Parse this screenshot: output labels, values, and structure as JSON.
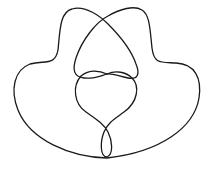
{
  "diagram": {
    "type": "knot-diagram",
    "stroke_color": "#1a1a1a",
    "background_color": "#ffffff",
    "crossings_visible": 6
  }
}
